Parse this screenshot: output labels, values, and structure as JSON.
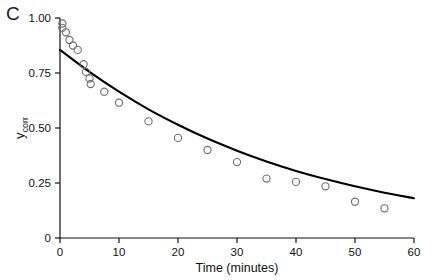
{
  "panel": {
    "label": "C"
  },
  "chart_data": {
    "type": "scatter",
    "title": "",
    "xlabel": "Time (minutes)",
    "ylabel": "y_corr",
    "ylabel_main": "y",
    "ylabel_sub": "corr",
    "xlim": [
      0,
      60
    ],
    "ylim": [
      0,
      1.0
    ],
    "xticks": [
      0,
      10,
      20,
      30,
      40,
      50,
      60
    ],
    "xticklabels": [
      "0",
      "10",
      "20",
      "30",
      "40",
      "50",
      "60"
    ],
    "yticks": [
      0,
      0.25,
      0.5,
      0.75,
      1.0
    ],
    "yticklabels": [
      "0",
      "0.25",
      "0.50",
      "0.75",
      "1.00"
    ],
    "grid": false,
    "legend": false,
    "marker": "open-circle",
    "marker_color": "#6f6f6f",
    "line_color": "#000000",
    "series": [
      {
        "name": "measured",
        "type": "scatter",
        "x": [
          0.4,
          0.4,
          1.0,
          1.6,
          2.2,
          3.0,
          4.0,
          4.4,
          5.0,
          5.2,
          7.5,
          10.0,
          15.0,
          20.0,
          25.0,
          30.0,
          35.0,
          40.0,
          45.0,
          50.0,
          55.0
        ],
        "y": [
          0.975,
          0.955,
          0.935,
          0.9,
          0.875,
          0.855,
          0.79,
          0.755,
          0.725,
          0.7,
          0.665,
          0.615,
          0.53,
          0.455,
          0.4,
          0.345,
          0.27,
          0.255,
          0.235,
          0.165,
          0.135
        ]
      },
      {
        "name": "fit",
        "type": "line",
        "equation_points_x": [
          0,
          5,
          10,
          15,
          20,
          25,
          30,
          35,
          40,
          45,
          50,
          55,
          60
        ],
        "equation_points_y": [
          0.855,
          0.755,
          0.665,
          0.585,
          0.515,
          0.452,
          0.397,
          0.348,
          0.305,
          0.268,
          0.235,
          0.206,
          0.181
        ]
      }
    ]
  }
}
